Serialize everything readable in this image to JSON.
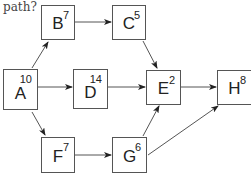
{
  "question_fragment": "path?",
  "nodes": {
    "A": {
      "label": "A",
      "duration": "10"
    },
    "B": {
      "label": "B",
      "duration": "7"
    },
    "C": {
      "label": "C",
      "duration": "5"
    },
    "D": {
      "label": "D",
      "duration": "14"
    },
    "E": {
      "label": "E",
      "duration": "2"
    },
    "F": {
      "label": "F",
      "duration": "7"
    },
    "G": {
      "label": "G",
      "duration": "6"
    },
    "H": {
      "label": "H",
      "duration": "8"
    }
  },
  "edges": [
    {
      "from": "A",
      "to": "B"
    },
    {
      "from": "A",
      "to": "D"
    },
    {
      "from": "A",
      "to": "F"
    },
    {
      "from": "B",
      "to": "C"
    },
    {
      "from": "C",
      "to": "E"
    },
    {
      "from": "D",
      "to": "E"
    },
    {
      "from": "F",
      "to": "G"
    },
    {
      "from": "G",
      "to": "E"
    },
    {
      "from": "G",
      "to": "H"
    },
    {
      "from": "E",
      "to": "H"
    }
  ]
}
